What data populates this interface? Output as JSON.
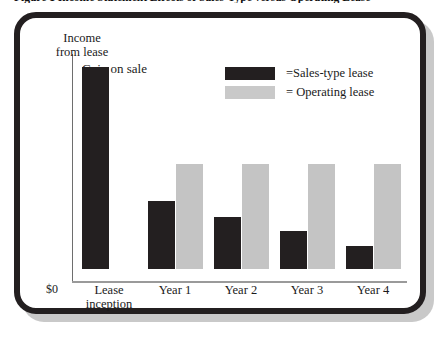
{
  "figure": {
    "title": "Figure 1  Income Statement Effects of Sales-Type versus Operating Lease"
  },
  "chart_data": {
    "type": "bar",
    "title": "Income Statement Effects of Sales-Type versus Operating Lease",
    "xlabel": "",
    "ylabel": "Income from lease",
    "y_axis_origin_label": "$0",
    "grid": false,
    "legend_position": "top-right",
    "annotations": [
      {
        "text": "Gain on sale",
        "category": "Lease inception",
        "series": "Sales-type lease"
      }
    ],
    "categories": [
      "Lease inception",
      "Year 1",
      "Year 2",
      "Year 3",
      "Year 4"
    ],
    "category_labels": [
      [
        "Lease",
        "inception"
      ],
      [
        "Year 1"
      ],
      [
        "Year 2"
      ],
      [
        "Year 3"
      ],
      [
        "Year 4"
      ]
    ],
    "ylim": [
      0,
      224
    ],
    "series": [
      {
        "name": "Sales-type lease",
        "legend_label": "=Sales-type lease",
        "color": "#231f20",
        "values": [
          202,
          68,
          52,
          38,
          23
        ]
      },
      {
        "name": "Operating lease",
        "legend_label": "= Operating lease",
        "color": "#c4c4c4",
        "values": [
          0,
          105,
          105,
          105,
          105
        ]
      }
    ]
  },
  "colors": {
    "sales_type": "#231f20",
    "operating": "#c4c4c4",
    "frame": "#231f20",
    "shadow": "#c9c9c9",
    "axis": "#9a9a9a",
    "text": "#1a1a1a",
    "background": "#ffffff"
  }
}
